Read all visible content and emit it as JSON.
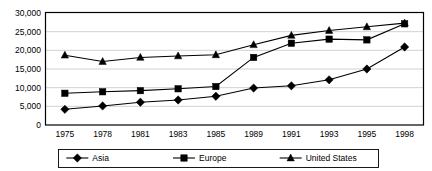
{
  "chart_data": {
    "type": "line",
    "title": "",
    "subtitle": "",
    "xlabel": "",
    "ylabel": "",
    "categories": [
      "1975",
      "1978",
      "1981",
      "1983",
      "1985",
      "1989",
      "1991",
      "1993",
      "1995",
      "1998"
    ],
    "ylim": [
      0,
      30000
    ],
    "yticks": [
      0,
      5000,
      10000,
      15000,
      20000,
      25000,
      30000
    ],
    "ytick_labels": [
      "0",
      "5,000",
      "10,000",
      "15,000",
      "20,000",
      "25,000",
      "30,000"
    ],
    "grid": true,
    "grid_axis": "y",
    "legend_position": "bottom",
    "series": [
      {
        "name": "Asia",
        "marker": "diamond",
        "color": "#000000",
        "values": [
          4200,
          5100,
          6100,
          6700,
          7700,
          9900,
          10500,
          12100,
          15000,
          20900
        ]
      },
      {
        "name": "Europe",
        "marker": "square",
        "color": "#000000",
        "values": [
          8500,
          8900,
          9200,
          9700,
          10300,
          18100,
          21900,
          23000,
          22800,
          27100
        ]
      },
      {
        "name": "United States",
        "marker": "triangle",
        "color": "#000000",
        "values": [
          18700,
          17000,
          18100,
          18500,
          18800,
          21500,
          24000,
          25300,
          26300,
          27300
        ]
      }
    ]
  },
  "legend": {
    "items": [
      {
        "label": "Asia",
        "marker": "diamond"
      },
      {
        "label": "Europe",
        "marker": "square"
      },
      {
        "label": "United States",
        "marker": "triangle"
      }
    ]
  },
  "colors": {
    "ink": "#000000",
    "grid": "#b3b3b3",
    "background": "#ffffff"
  }
}
